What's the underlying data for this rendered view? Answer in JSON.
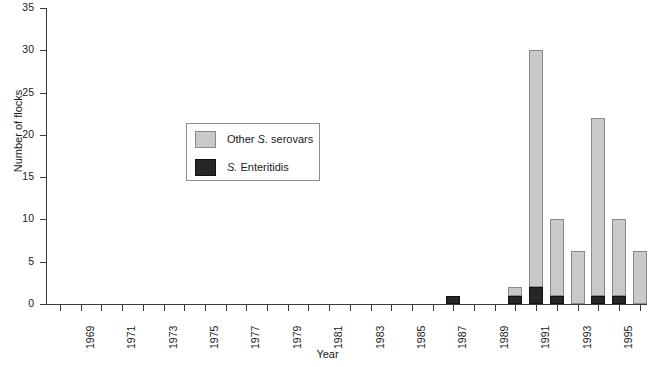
{
  "chart_data": {
    "type": "bar",
    "subtype": "stacked-vertical",
    "title": "",
    "xlabel": "Year",
    "ylabel": "Number of flocks",
    "ylim": [
      0,
      35
    ],
    "y_ticks": [
      0,
      5,
      10,
      15,
      20,
      25,
      30,
      35
    ],
    "grid": false,
    "legend_position": "inside-upper-left",
    "categories": [
      "1968",
      "1969",
      "1970",
      "1971",
      "1972",
      "1973",
      "1974",
      "1975",
      "1976",
      "1977",
      "1978",
      "1979",
      "1980",
      "1981",
      "1982",
      "1983",
      "1984",
      "1985",
      "1986",
      "1987",
      "1988",
      "1989",
      "1990",
      "1991",
      "1992",
      "1993",
      "1994",
      "1995",
      "1996"
    ],
    "x_tick_labels": [
      "",
      "1969",
      "",
      "1971",
      "",
      "1973",
      "",
      "1975",
      "",
      "1977",
      "",
      "1979",
      "",
      "1981",
      "",
      "1983",
      "",
      "1985",
      "",
      "1987",
      "",
      "1989",
      "",
      "1991",
      "",
      "1993",
      "",
      "1995",
      ""
    ],
    "series": [
      {
        "name": "S. Enteritidis",
        "color": "#262626",
        "values": [
          0,
          0,
          0,
          0,
          0,
          0,
          0,
          0,
          0,
          0,
          0,
          0,
          0,
          0,
          0,
          0,
          0,
          0,
          0,
          1,
          0,
          0,
          1,
          2,
          1,
          0,
          1,
          1,
          0
        ]
      },
      {
        "name": "Other S. serovars",
        "color": "#c9c9c9",
        "values": [
          0,
          0,
          0,
          0,
          0,
          0,
          0,
          0,
          0,
          0,
          0,
          0,
          0,
          0,
          0,
          0,
          0,
          0,
          0,
          0,
          0,
          0,
          1,
          28,
          9,
          6.3,
          21,
          9,
          6.3
        ]
      }
    ],
    "totals": [
      0,
      0,
      0,
      0,
      0,
      0,
      0,
      0,
      0,
      0,
      0,
      0,
      0,
      0,
      0,
      0,
      0,
      0,
      0,
      1,
      0,
      0,
      2,
      30,
      10,
      6.3,
      22,
      10,
      6.3
    ]
  },
  "axes": {
    "y_title": "Number of flocks",
    "x_title": "Year",
    "y_tick_labels": [
      "0",
      "5",
      "10",
      "15",
      "20",
      "25",
      "30",
      "35"
    ]
  },
  "legend": {
    "items": [
      {
        "label_html": "Other <i>S.</i> serovars",
        "color": "#c9c9c9",
        "name": "other-serovars"
      },
      {
        "label_html": "<i>S.</i> Enteritidis",
        "color": "#262626",
        "name": "s-enteritidis"
      }
    ]
  },
  "colors": {
    "other_serovars": "#c9c9c9",
    "s_enteritidis": "#262626",
    "axis": "#3a3a3a",
    "text": "#1a1a1a",
    "background": "#ffffff"
  }
}
